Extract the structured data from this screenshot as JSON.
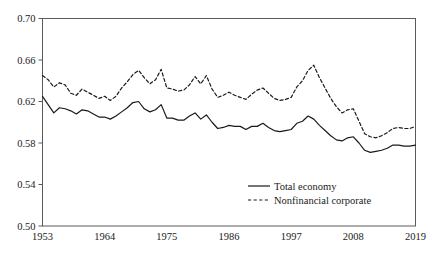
{
  "chart_data": {
    "type": "line",
    "title": "",
    "subtitle": "",
    "xlabel": "",
    "ylabel": "",
    "xlim": [
      1953,
      2019
    ],
    "ylim": [
      0.5,
      0.7
    ],
    "grid": false,
    "legend_position": "bottom-right",
    "xticks": [
      "1953",
      "1964",
      "1975",
      "1986",
      "1997",
      "2008",
      "2019"
    ],
    "xtick_values": [
      1953,
      1964,
      1975,
      1986,
      1997,
      2008,
      2019
    ],
    "yticks": [
      "0.50",
      "0.54",
      "0.58",
      "0.62",
      "0.66",
      "0.70"
    ],
    "ytick_values": [
      0.5,
      0.54,
      0.58,
      0.62,
      0.66,
      0.7
    ],
    "x": [
      1953,
      1954,
      1955,
      1956,
      1957,
      1958,
      1959,
      1960,
      1961,
      1962,
      1963,
      1964,
      1965,
      1966,
      1967,
      1968,
      1969,
      1970,
      1971,
      1972,
      1973,
      1974,
      1975,
      1976,
      1977,
      1978,
      1979,
      1980,
      1981,
      1982,
      1983,
      1984,
      1985,
      1986,
      1987,
      1988,
      1989,
      1990,
      1991,
      1992,
      1993,
      1994,
      1995,
      1996,
      1997,
      1998,
      1999,
      2000,
      2001,
      2002,
      2003,
      2004,
      2005,
      2006,
      2007,
      2008,
      2009,
      2010,
      2011,
      2012,
      2013,
      2014,
      2015,
      2016,
      2017,
      2018,
      2019
    ],
    "series": [
      {
        "name": "Total economy",
        "style": "solid",
        "color": "#1a1a1a",
        "values": [
          0.625,
          0.617,
          0.609,
          0.614,
          0.613,
          0.611,
          0.608,
          0.612,
          0.611,
          0.608,
          0.605,
          0.605,
          0.603,
          0.606,
          0.61,
          0.614,
          0.619,
          0.62,
          0.613,
          0.61,
          0.612,
          0.617,
          0.604,
          0.604,
          0.602,
          0.602,
          0.606,
          0.609,
          0.603,
          0.607,
          0.6,
          0.594,
          0.595,
          0.597,
          0.596,
          0.596,
          0.593,
          0.596,
          0.596,
          0.599,
          0.595,
          0.592,
          0.591,
          0.592,
          0.593,
          0.599,
          0.601,
          0.606,
          0.603,
          0.597,
          0.592,
          0.587,
          0.583,
          0.582,
          0.585,
          0.586,
          0.58,
          0.573,
          0.571,
          0.572,
          0.573,
          0.575,
          0.578,
          0.578,
          0.577,
          0.577,
          0.578
        ]
      },
      {
        "name": "Nonfinancial corporate",
        "style": "dashed",
        "color": "#1a1a1a",
        "values": [
          0.645,
          0.641,
          0.634,
          0.638,
          0.636,
          0.628,
          0.626,
          0.632,
          0.629,
          0.626,
          0.623,
          0.625,
          0.621,
          0.625,
          0.633,
          0.639,
          0.646,
          0.65,
          0.643,
          0.637,
          0.641,
          0.651,
          0.633,
          0.632,
          0.63,
          0.631,
          0.636,
          0.644,
          0.637,
          0.645,
          0.632,
          0.624,
          0.626,
          0.629,
          0.626,
          0.624,
          0.622,
          0.627,
          0.631,
          0.633,
          0.628,
          0.623,
          0.621,
          0.622,
          0.624,
          0.634,
          0.64,
          0.65,
          0.655,
          0.643,
          0.633,
          0.623,
          0.615,
          0.609,
          0.612,
          0.613,
          0.601,
          0.589,
          0.586,
          0.585,
          0.587,
          0.59,
          0.594,
          0.595,
          0.594,
          0.594,
          0.596
        ]
      }
    ]
  },
  "legend": {
    "items": [
      {
        "label": "Total economy",
        "style": "solid"
      },
      {
        "label": "Nonfinancial corporate",
        "style": "dashed"
      }
    ]
  }
}
